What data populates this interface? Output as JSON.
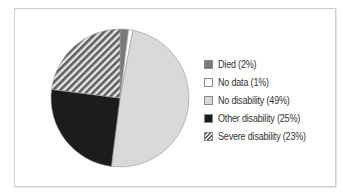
{
  "chart_data": {
    "type": "pie",
    "title": "",
    "slices": [
      {
        "label": "Died",
        "value": 2,
        "color": "#7a7a7a",
        "pattern": "solid"
      },
      {
        "label": "No data",
        "value": 1,
        "color": "#ffffff",
        "pattern": "solid"
      },
      {
        "label": "No disability",
        "value": 49,
        "color": "#d9d9d9",
        "pattern": "solid"
      },
      {
        "label": "Other disability",
        "value": 25,
        "color": "#1c1c1c",
        "pattern": "solid"
      },
      {
        "label": "Severe disability",
        "value": 23,
        "color": "#6e6e6e",
        "pattern": "diagonal-hatch"
      }
    ],
    "legend_position": "right",
    "start_angle_deg": 0,
    "direction": "clockwise"
  },
  "legend": {
    "items": [
      {
        "label": "Died (2%)"
      },
      {
        "label": "No data (1%)"
      },
      {
        "label": "No disability (49%)"
      },
      {
        "label": "Other disability (25%)"
      },
      {
        "label": "Severe disability (23%)"
      }
    ]
  }
}
